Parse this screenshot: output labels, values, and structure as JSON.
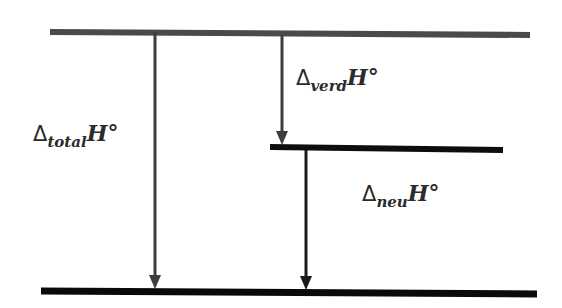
{
  "diagram": {
    "type": "energy-level-diagram",
    "colors": {
      "top_level": "#4a4a4a",
      "middle_level": "#0d0d0d",
      "bottom_level": "#0a0a0a",
      "arrow": "#3d3d3d",
      "text": "#2b2b2b"
    },
    "levels": [
      {
        "id": "top",
        "x1": 50,
        "x2": 530,
        "y": 32
      },
      {
        "id": "middle",
        "x1": 270,
        "x2": 503,
        "y": 148
      },
      {
        "id": "bottom",
        "x1": 41,
        "x2": 537,
        "y": 292
      }
    ],
    "arrows": [
      {
        "id": "total",
        "x": 155,
        "from": "top",
        "to": "bottom"
      },
      {
        "id": "verd",
        "x": 282,
        "from": "top",
        "to": "middle"
      },
      {
        "id": "neu",
        "x": 306,
        "from": "middle",
        "to": "bottom"
      }
    ],
    "labels": {
      "total": {
        "delta": "Δ",
        "sub": "total",
        "symbol": "H°"
      },
      "verd": {
        "delta": "Δ",
        "sub": "verd",
        "symbol": "H°"
      },
      "neu": {
        "delta": "Δ",
        "sub": "neu",
        "symbol": "H°"
      }
    }
  }
}
